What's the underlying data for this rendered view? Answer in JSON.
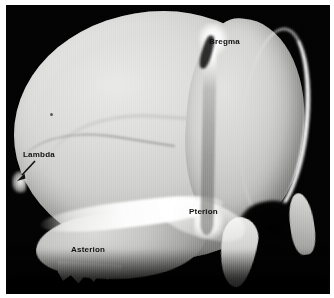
{
  "figure": {
    "kind": "anatomical-photograph",
    "view": "lateral view of an infant skull",
    "background_color": "#030303",
    "page_color": "#ffffff",
    "bone_color": "#d8d8d6",
    "suture_highlight_color": "#ffffff",
    "label_color": "#111111"
  },
  "labels": {
    "bregma": "Bregma",
    "lambda": "Lambda",
    "pterion": "Pterion",
    "asterion": "Asterion"
  },
  "annotations": {
    "lambda_arrow": "arrow-pointing-down-left"
  },
  "regions": {
    "cranium": "cranial-vault",
    "frontal": "frontal-bone",
    "temporal": "temporal-bone",
    "sphenoid": "greater-wing-of-sphenoid",
    "mastoid": "mastoid-process",
    "fossa": "temporal-fossa",
    "coronal_suture": "coronal-suture",
    "lambdoid_suture": "lambdoid-suture",
    "squamosal_suture": "squamosal-suture"
  }
}
